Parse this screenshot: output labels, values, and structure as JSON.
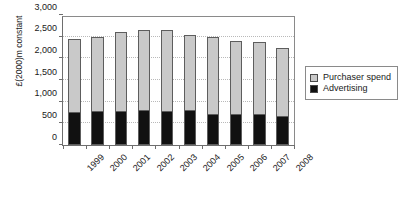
{
  "chart_data": {
    "type": "bar",
    "subtype": "stacked-vertical",
    "title": "",
    "xlabel": "",
    "ylabel": "£(2000)m constant",
    "ylim": [
      0,
      3000
    ],
    "yticks": [
      0,
      500,
      1000,
      1500,
      2000,
      2500,
      3000
    ],
    "ytick_labels": [
      "0",
      "500",
      "1,000",
      "1,500",
      "2,000",
      "2,500",
      "3,000"
    ],
    "grid": true,
    "grid_axis": "y",
    "legend_position": "right",
    "categories": [
      "1999",
      "2000",
      "2001",
      "2002",
      "2003",
      "2004",
      "2005",
      "2006",
      "2007",
      "2008"
    ],
    "series": [
      {
        "name": "Advertising",
        "color": "#111111",
        "values": [
          740,
          760,
          770,
          775,
          765,
          790,
          700,
          690,
          690,
          650
        ]
      },
      {
        "name": "Purchaser spend",
        "color": "#c9c9c9",
        "values": [
          1710,
          1730,
          1840,
          1885,
          1885,
          1760,
          1790,
          1710,
          1690,
          1590
        ]
      }
    ],
    "totals": [
      2450,
      2490,
      2610,
      2660,
      2650,
      2550,
      2490,
      2400,
      2380,
      2240
    ]
  },
  "legend": {
    "items": [
      {
        "label": "Purchaser spend",
        "color": "#c9c9c9"
      },
      {
        "label": "Advertising",
        "color": "#111111"
      }
    ]
  }
}
